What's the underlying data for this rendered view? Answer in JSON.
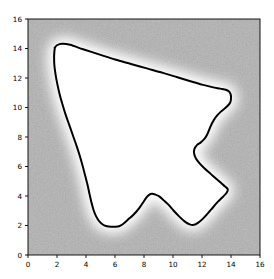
{
  "figure": {
    "width": 274,
    "height": 279,
    "background_color": "#ffffff",
    "title": "",
    "xlabel": "",
    "ylabel": ""
  },
  "axes": {
    "left": 28,
    "top": 19,
    "right": 260,
    "bottom": 255,
    "spine_color": "#000000",
    "tick_color": "#000000"
  },
  "chart_data": {
    "type": "heatmap",
    "title": "",
    "xlabel": "",
    "ylabel": "",
    "xlim": [
      0,
      16
    ],
    "ylim": [
      0,
      16
    ],
    "grid": false,
    "legend": "none",
    "colormap": "gray",
    "background_fill_color": "#888888",
    "interior_fill_color": "#ffffff",
    "glow_color": "#ffffff",
    "contour_line_color": "#000000",
    "contour_line_width": 2,
    "contour_level": 0.5,
    "x_ticks": [
      0,
      2,
      4,
      6,
      8,
      10,
      12,
      14,
      16
    ],
    "y_ticks": [
      0,
      2,
      4,
      6,
      8,
      10,
      12,
      14,
      16
    ],
    "x_tick_labels": [
      "0",
      "2",
      "4",
      "6",
      "8",
      "10",
      "12",
      "14",
      "16"
    ],
    "y_tick_labels": [
      "0",
      "2",
      "4",
      "6",
      "8",
      "10",
      "12",
      "14",
      "16"
    ],
    "contour_polygon": [
      [
        1.85,
        14.05
      ],
      [
        2.0,
        14.22
      ],
      [
        2.35,
        14.32
      ],
      [
        2.9,
        14.25
      ],
      [
        3.8,
        13.95
      ],
      [
        4.9,
        13.6
      ],
      [
        6.0,
        13.25
      ],
      [
        7.1,
        12.95
      ],
      [
        8.2,
        12.65
      ],
      [
        9.3,
        12.35
      ],
      [
        10.3,
        12.05
      ],
      [
        11.2,
        11.78
      ],
      [
        12.0,
        11.55
      ],
      [
        12.7,
        11.38
      ],
      [
        13.25,
        11.28
      ],
      [
        13.65,
        11.2
      ],
      [
        13.9,
        11.05
      ],
      [
        14.0,
        10.75
      ],
      [
        13.95,
        10.35
      ],
      [
        13.7,
        10.05
      ],
      [
        13.3,
        9.72
      ],
      [
        12.95,
        9.35
      ],
      [
        12.7,
        8.95
      ],
      [
        12.52,
        8.55
      ],
      [
        12.35,
        8.15
      ],
      [
        12.15,
        7.85
      ],
      [
        11.9,
        7.62
      ],
      [
        11.65,
        7.45
      ],
      [
        11.48,
        7.2
      ],
      [
        11.45,
        6.9
      ],
      [
        11.58,
        6.55
      ],
      [
        11.85,
        6.2
      ],
      [
        12.2,
        5.85
      ],
      [
        12.6,
        5.5
      ],
      [
        13.0,
        5.15
      ],
      [
        13.35,
        4.85
      ],
      [
        13.62,
        4.62
      ],
      [
        13.78,
        4.45
      ],
      [
        13.7,
        4.22
      ],
      [
        13.45,
        3.95
      ],
      [
        13.1,
        3.62
      ],
      [
        12.75,
        3.22
      ],
      [
        12.4,
        2.82
      ],
      [
        12.05,
        2.45
      ],
      [
        11.72,
        2.18
      ],
      [
        11.45,
        2.05
      ],
      [
        11.15,
        2.08
      ],
      [
        10.8,
        2.28
      ],
      [
        10.42,
        2.62
      ],
      [
        10.05,
        3.0
      ],
      [
        9.7,
        3.4
      ],
      [
        9.35,
        3.72
      ],
      [
        9.05,
        3.98
      ],
      [
        8.78,
        4.1
      ],
      [
        8.55,
        4.15
      ],
      [
        8.35,
        4.08
      ],
      [
        8.15,
        3.88
      ],
      [
        7.95,
        3.58
      ],
      [
        7.72,
        3.25
      ],
      [
        7.48,
        2.95
      ],
      [
        7.22,
        2.68
      ],
      [
        6.95,
        2.45
      ],
      [
        6.7,
        2.22
      ],
      [
        6.48,
        2.05
      ],
      [
        6.28,
        1.95
      ],
      [
        6.05,
        1.92
      ],
      [
        5.75,
        1.92
      ],
      [
        5.45,
        1.95
      ],
      [
        5.18,
        2.05
      ],
      [
        4.92,
        2.28
      ],
      [
        4.7,
        2.62
      ],
      [
        4.52,
        3.05
      ],
      [
        4.38,
        3.55
      ],
      [
        4.25,
        4.1
      ],
      [
        4.12,
        4.7
      ],
      [
        3.95,
        5.35
      ],
      [
        3.78,
        6.0
      ],
      [
        3.58,
        6.7
      ],
      [
        3.35,
        7.4
      ],
      [
        3.1,
        8.1
      ],
      [
        2.85,
        8.8
      ],
      [
        2.6,
        9.5
      ],
      [
        2.38,
        10.2
      ],
      [
        2.18,
        10.9
      ],
      [
        2.02,
        11.6
      ],
      [
        1.9,
        12.25
      ],
      [
        1.82,
        12.85
      ],
      [
        1.8,
        13.4
      ],
      [
        1.82,
        13.8
      ],
      [
        1.85,
        14.05
      ]
    ],
    "feature_points": {
      "apex_left_top": [
        2.35,
        14.32
      ],
      "rightmost": [
        14.0,
        10.75
      ],
      "right_notch_inward": [
        11.45,
        6.9
      ],
      "bottom_left_flat": [
        5.9,
        1.92
      ],
      "bottom_mid_bump_peak": [
        8.55,
        4.15
      ],
      "bottom_right_low": [
        11.45,
        2.05
      ],
      "left_lower_vertex": [
        4.9,
        2.28
      ]
    }
  }
}
